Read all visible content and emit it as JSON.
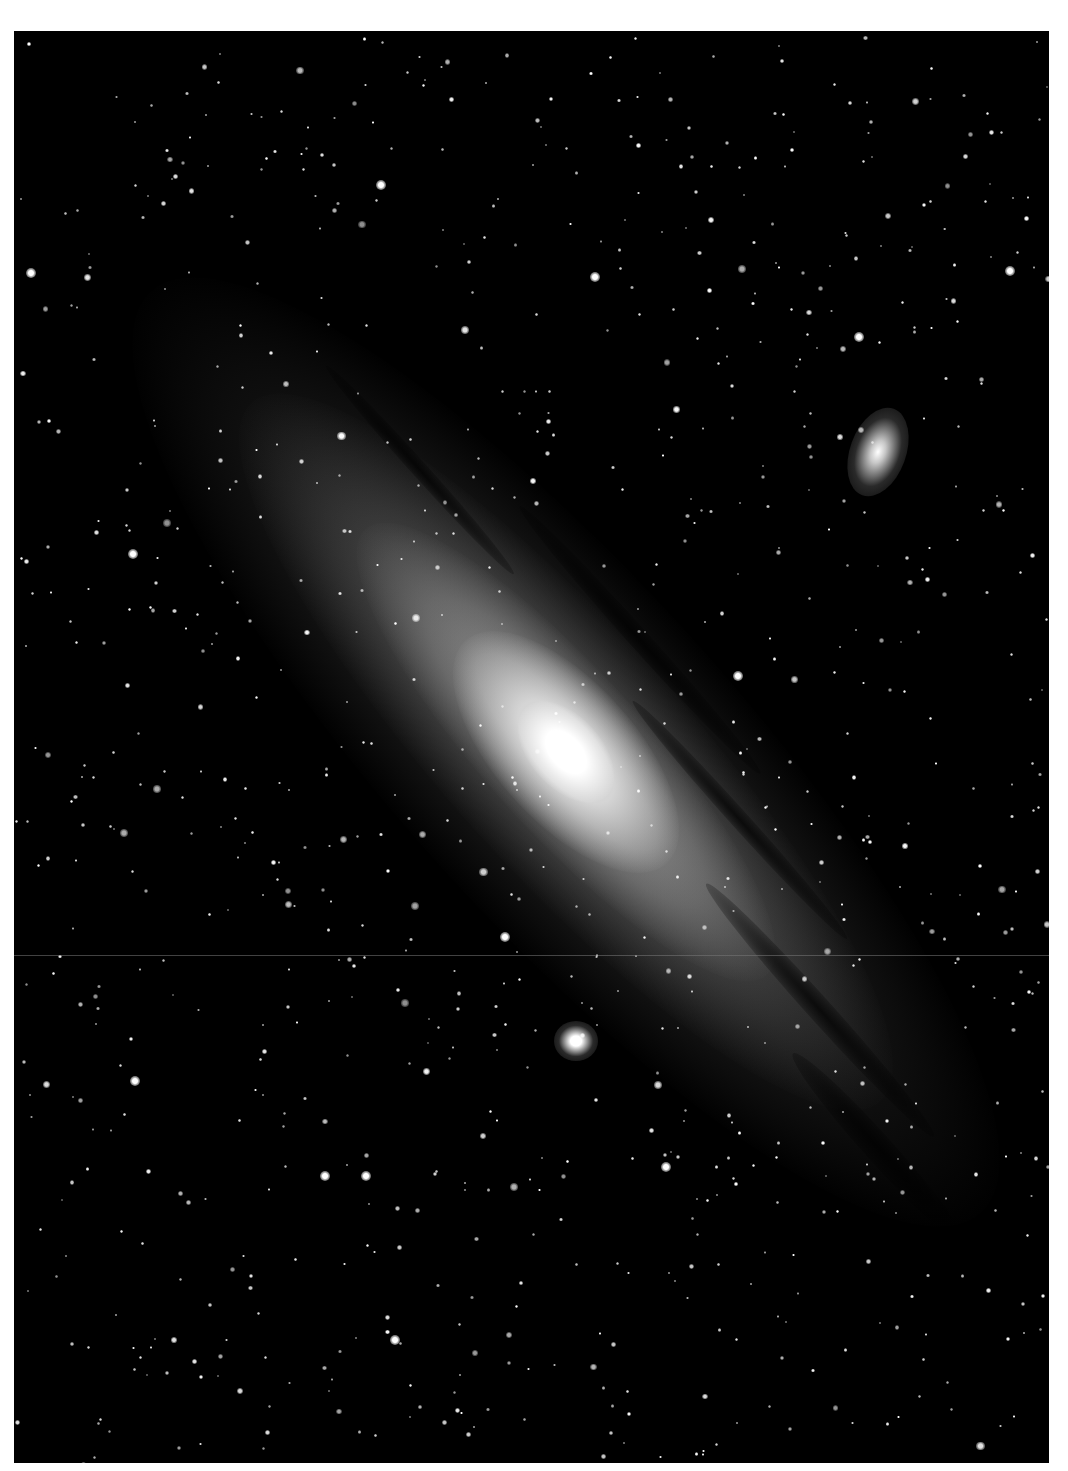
{
  "image": {
    "subject": "Andromeda Galaxy with companion galaxies",
    "width": 1068,
    "height": 1471,
    "frame": {
      "left": 14,
      "top": 31,
      "width": 1035,
      "height": 1432
    },
    "border_color": "#ffffff",
    "sky_color": "#000000"
  },
  "galaxy": {
    "center": {
      "x": 566,
      "y": 752
    },
    "angle_deg": 48,
    "layers": [
      {
        "name": "outer-disk",
        "rx": 620,
        "ry": 170,
        "color": "rgba(150,150,150,0.22)"
      },
      {
        "name": "mid-disk",
        "rx": 470,
        "ry": 120,
        "color": "rgba(170,170,170,0.30)"
      },
      {
        "name": "inner-disk",
        "rx": 300,
        "ry": 80,
        "color": "rgba(200,200,200,0.40)"
      },
      {
        "name": "bulge",
        "rx": 150,
        "ry": 70,
        "color": "rgba(235,235,235,0.80)"
      },
      {
        "name": "core",
        "rx": 60,
        "ry": 36,
        "color": "rgba(255,255,255,1)"
      }
    ],
    "dust_lanes": [
      {
        "x": 640,
        "y": 640,
        "rx": 180,
        "ry": 10
      },
      {
        "x": 740,
        "y": 820,
        "rx": 160,
        "ry": 9
      },
      {
        "x": 820,
        "y": 1010,
        "rx": 170,
        "ry": 12
      },
      {
        "x": 880,
        "y": 1150,
        "rx": 130,
        "ry": 14
      },
      {
        "x": 420,
        "y": 470,
        "rx": 140,
        "ry": 8
      }
    ]
  },
  "companions": [
    {
      "name": "upper-right-elliptical",
      "x": 878,
      "y": 452,
      "rx": 28,
      "ry": 46,
      "angle_deg": 20,
      "color": "rgba(220,220,220,0.9)"
    },
    {
      "name": "lower-compact-elliptical",
      "x": 576,
      "y": 1041,
      "rx": 22,
      "ry": 20,
      "angle_deg": 0,
      "color": "rgba(255,255,255,1)"
    }
  ],
  "seam": {
    "y": 924
  },
  "stars": {
    "count": 900,
    "seed": 31,
    "bright": [
      {
        "x": 31,
        "y": 273
      },
      {
        "x": 381,
        "y": 185
      },
      {
        "x": 440,
        "y": 18
      },
      {
        "x": 666,
        "y": 1167
      },
      {
        "x": 325,
        "y": 1176
      },
      {
        "x": 135,
        "y": 1081
      },
      {
        "x": 505,
        "y": 937
      },
      {
        "x": 1010,
        "y": 271
      },
      {
        "x": 738,
        "y": 676
      },
      {
        "x": 595,
        "y": 277
      },
      {
        "x": 133,
        "y": 554
      },
      {
        "x": 366,
        "y": 1176
      },
      {
        "x": 395,
        "y": 1340
      },
      {
        "x": 859,
        "y": 337
      }
    ]
  }
}
